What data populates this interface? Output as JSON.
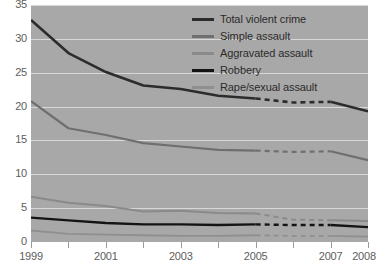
{
  "chart_data": {
    "type": "line",
    "title": "",
    "subtitle": "",
    "xlabel": "",
    "ylabel": "",
    "xlim": [
      1999,
      2008
    ],
    "ylim": [
      0,
      35
    ],
    "grid": true,
    "legend_position": "top-right",
    "y_ticks": [
      35,
      30,
      25,
      20,
      15,
      10,
      5,
      0
    ],
    "x_ticks": [
      1999,
      2000,
      2001,
      2002,
      2003,
      2004,
      2005,
      2006,
      2007,
      2008
    ],
    "x_tick_labels": [
      "1999",
      "",
      "2001",
      "",
      "2003",
      "",
      "2005",
      "",
      "2007",
      "2008"
    ],
    "x": [
      1999,
      2000,
      2001,
      2002,
      2003,
      2004,
      2005,
      2006,
      2007,
      2008
    ],
    "dashed_from": 2005,
    "dashed_to": 2007,
    "series": [
      {
        "name": "Total violent crime",
        "color": "#2c2c2c",
        "width": 2.6,
        "values": [
          32.8,
          27.9,
          25.1,
          23.1,
          22.6,
          21.6,
          21.2,
          20.6,
          20.7,
          19.3
        ]
      },
      {
        "name": "Simple assault",
        "color": "#6f6f6f",
        "width": 2.2,
        "values": [
          20.8,
          16.8,
          15.8,
          14.6,
          14.1,
          13.6,
          13.5,
          13.3,
          13.4,
          12.1
        ]
      },
      {
        "name": "Aggravated assault",
        "color": "#8a8a8a",
        "width": 2.0,
        "values": [
          6.7,
          5.8,
          5.3,
          4.5,
          4.6,
          4.3,
          4.2,
          3.3,
          3.2,
          3.1
        ]
      },
      {
        "name": "Robbery",
        "color": "#141414",
        "width": 2.4,
        "values": [
          3.6,
          3.2,
          2.8,
          2.6,
          2.6,
          2.5,
          2.6,
          2.5,
          2.5,
          2.2
        ]
      },
      {
        "name": "Rape/sexual assault",
        "color": "#8f8f8f",
        "width": 1.8,
        "values": [
          1.7,
          1.2,
          1.1,
          1.0,
          0.9,
          0.9,
          1.0,
          0.9,
          0.9,
          0.8
        ]
      }
    ]
  },
  "legend": {
    "entries": [
      {
        "label": "Total violent crime",
        "color": "#2c2c2c",
        "thickness": "3px"
      },
      {
        "label": "Simple assault",
        "color": "#6f6f6f",
        "thickness": "3px"
      },
      {
        "label": "Aggravated assault",
        "color": "#8a8a8a",
        "thickness": "3px"
      },
      {
        "label": "Robbery",
        "color": "#141414",
        "thickness": "3px"
      },
      {
        "label": "Rape/sexual assault",
        "color": "#8f8f8f",
        "thickness": "3px"
      }
    ]
  },
  "colors": {
    "plot_background": "#a8a8a8",
    "page_background": "#ffffff",
    "gridline": "#d8d8d8",
    "axis_text": "#5d5d5d",
    "legend_text": "#2b2b2b"
  }
}
